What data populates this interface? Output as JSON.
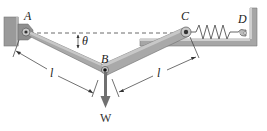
{
  "diagram": {
    "type": "mechanics-linkage",
    "labels": {
      "pin_a": "A",
      "pin_b": "B",
      "pin_c": "C",
      "point_d": "D",
      "angle": "θ",
      "length_left": "l",
      "length_right": "l",
      "weight": "W"
    },
    "colors": {
      "bar_fill": "#a9a9a9",
      "bar_edge": "#6e6e6e",
      "support_fill": "#9a9a9a",
      "support_light": "#c8c8c8",
      "line": "#333333",
      "weight_arrow": "#707070"
    }
  }
}
